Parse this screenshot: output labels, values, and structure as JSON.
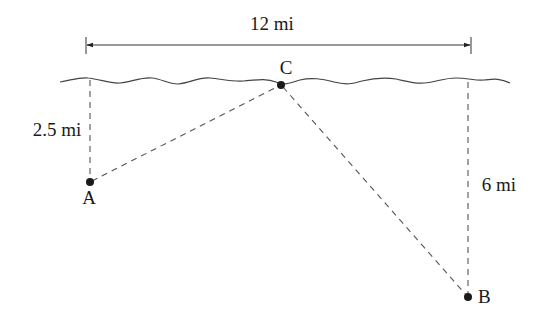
{
  "diagram": {
    "dimension_top": {
      "label": "12 mi",
      "x1": 86,
      "x2": 471,
      "y": 45
    },
    "shoreline": {
      "x_start": 60,
      "x_end": 510,
      "y": 81
    },
    "points": [
      {
        "id": "A",
        "label": "A",
        "x": 90,
        "y": 182,
        "label_x": 89,
        "label_y": 204
      },
      {
        "id": "B",
        "label": "B",
        "x": 468,
        "y": 297,
        "label_x": 485,
        "label_y": 303
      },
      {
        "id": "C",
        "label": "C",
        "x": 281,
        "y": 85,
        "label_x": 286,
        "label_y": 74
      }
    ],
    "distances": [
      {
        "id": "A-shore",
        "label": "2.5 mi",
        "label_x": 57,
        "label_y": 136
      },
      {
        "id": "B-shore",
        "label": "6 mi",
        "label_x": 499,
        "label_y": 191
      }
    ],
    "segments": [
      {
        "from": "A",
        "to": "C",
        "style": "dashed"
      },
      {
        "from": "C",
        "to": "B",
        "style": "dashed"
      },
      {
        "from": "A",
        "to": "shore",
        "style": "dashed"
      },
      {
        "from": "B",
        "to": "shore",
        "style": "dashed"
      }
    ]
  }
}
